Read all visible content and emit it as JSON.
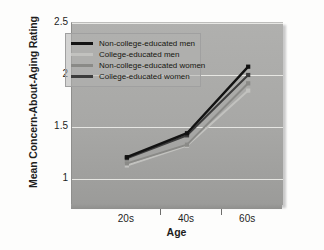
{
  "chart_data": {
    "type": "line",
    "title": "",
    "xlabel": "Age",
    "ylabel": "Mean Concern-About-Aging Rating",
    "categories": [
      "20s",
      "40s",
      "60s"
    ],
    "yticks": [
      "1",
      "1.5",
      "2",
      "2.5"
    ],
    "ytick_values": [
      1,
      1.5,
      2,
      2.5
    ],
    "ylim": [
      0.75,
      2.5
    ],
    "grid": true,
    "legend_position": "upper-left",
    "markers": "square",
    "series": [
      {
        "name": "Non-college-educated men",
        "color": "#121212",
        "values": [
          1.21,
          1.44,
          2.08
        ]
      },
      {
        "name": "College-educated men",
        "color": "#c2c2bf",
        "values": [
          1.13,
          1.32,
          1.85
        ]
      },
      {
        "name": "Non-college-educated women",
        "color": "#8a8a87",
        "values": [
          1.15,
          1.33,
          1.92
        ]
      },
      {
        "name": "College-educated women",
        "color": "#3c3c3c",
        "values": [
          1.2,
          1.42,
          2.0
        ]
      }
    ]
  },
  "axis": {
    "x_title": "Age",
    "y_title": "Mean Concern-About-Aging Rating"
  }
}
